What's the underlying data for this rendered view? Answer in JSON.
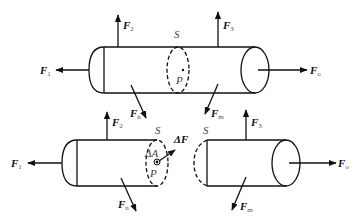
{
  "figure": {
    "top_body": {
      "forces": [
        {
          "label": "F",
          "sub": "1"
        },
        {
          "label": "F",
          "sub": "2"
        },
        {
          "label": "F",
          "sub": "3"
        },
        {
          "label": "F",
          "sub": "n"
        },
        {
          "label": "F",
          "sub": "m"
        },
        {
          "label": "F",
          "sub": "o"
        }
      ],
      "section_label": "S",
      "point_label": "P"
    },
    "bottom_left": {
      "forces": [
        {
          "label": "F",
          "sub": "1"
        },
        {
          "label": "F",
          "sub": "2"
        },
        {
          "label": "F",
          "sub": "n"
        }
      ],
      "section_label": "S",
      "area_label": "ΔA",
      "point_label": "P",
      "internal_force_label": "ΔF"
    },
    "bottom_right": {
      "forces": [
        {
          "label": "F",
          "sub": "3"
        },
        {
          "label": "F",
          "sub": "m"
        },
        {
          "label": "F",
          "sub": "o"
        }
      ],
      "section_label": "S"
    }
  }
}
